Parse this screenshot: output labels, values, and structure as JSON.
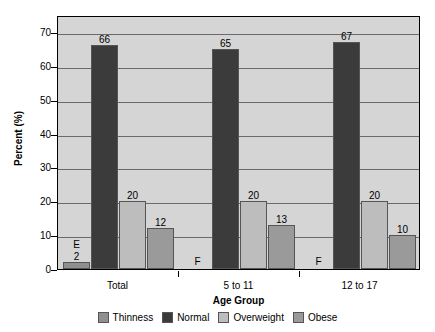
{
  "chart_data": {
    "type": "bar",
    "title": "",
    "xlabel": "Age Group",
    "ylabel": "Percent (%)",
    "ylim": [
      0,
      75
    ],
    "yticks": [
      0,
      10,
      20,
      30,
      40,
      50,
      60,
      70
    ],
    "grid": true,
    "legend_position": "bottom",
    "categories": [
      "Total",
      "5 to 11",
      "12 to 17"
    ],
    "series": [
      {
        "name": "Thinness",
        "color": "#8f8f8f",
        "values": [
          2,
          null,
          null
        ],
        "labels": [
          "2",
          "F",
          "F"
        ],
        "flags": [
          "E",
          "F",
          "F"
        ]
      },
      {
        "name": "Normal",
        "color": "#3b3b3b",
        "values": [
          66,
          65,
          67
        ],
        "labels": [
          "66",
          "65",
          "67"
        ],
        "flags": [
          "",
          "",
          ""
        ]
      },
      {
        "name": "Overweight",
        "color": "#bdbdbd",
        "values": [
          20,
          20,
          20
        ],
        "labels": [
          "20",
          "20",
          "20"
        ],
        "flags": [
          "",
          "",
          ""
        ]
      },
      {
        "name": "Obese",
        "color": "#9a9a9a",
        "values": [
          12,
          13,
          10
        ],
        "labels": [
          "12",
          "13",
          "10"
        ],
        "flags": [
          "",
          "",
          ""
        ]
      }
    ]
  },
  "axes": {
    "y_title": "Percent (%)",
    "x_title": "Age Group",
    "y_tick_labels": [
      "70",
      "60",
      "50",
      "40",
      "30",
      "20",
      "10",
      "0"
    ],
    "x_tick_labels": [
      "Total",
      "5 to 11",
      "12 to 17"
    ]
  },
  "legend": {
    "items": [
      {
        "label": "Thinness",
        "color": "#8f8f8f"
      },
      {
        "label": "Normal",
        "color": "#3b3b3b"
      },
      {
        "label": "Overweight",
        "color": "#bdbdbd"
      },
      {
        "label": "Obese",
        "color": "#9a9a9a"
      }
    ]
  },
  "annotations": {
    "e_marker": "E",
    "f_marker": "F"
  },
  "colors": {
    "plot_background": "#d5d5d5",
    "gridline": "#6a6a6a",
    "axis": "#000000",
    "page_background": "#ffffff"
  }
}
